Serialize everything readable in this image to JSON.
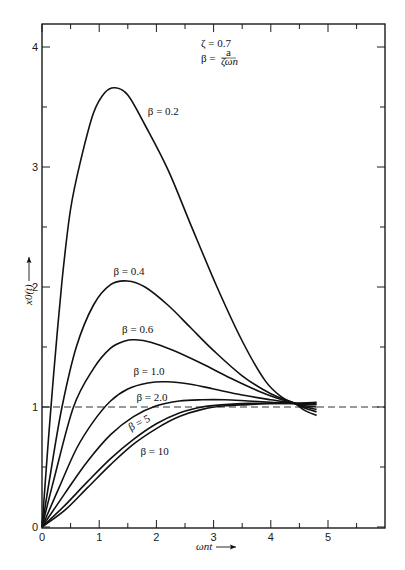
{
  "chart_data": {
    "type": "line",
    "title": "",
    "xlabel": "ωnt ⟶",
    "ylabel": "x0(t) ⟶",
    "xlim": [
      0,
      6
    ],
    "ylim": [
      0,
      4.2
    ],
    "grid": false,
    "x_ticks": [
      0,
      1,
      2,
      3,
      4,
      5
    ],
    "x_minor_ticks": [
      0.5,
      1.5,
      2.5,
      3.5,
      4.5,
      5.5
    ],
    "y_ticks": [
      0,
      1,
      2,
      3,
      4
    ],
    "y_minor_ticks": [
      0.5,
      1.5,
      2.5,
      3.5
    ],
    "annotations": [
      {
        "text": "ζ = 0.7",
        "x": 3.0,
        "y": 3.95
      },
      {
        "text": "β = a / (ζωn)",
        "x": 3.0,
        "y": 3.78
      }
    ],
    "reference_line": {
      "y": 1,
      "style": "dashed",
      "label": "steady state"
    },
    "series": [
      {
        "name": "β = 0.2",
        "label_pos": [
          1.85,
          3.43
        ],
        "label_rot": 0,
        "x": [
          0,
          0.1,
          0.2,
          0.35,
          0.5,
          0.7,
          0.9,
          1.1,
          1.28,
          1.5,
          1.8,
          2.2,
          2.6,
          3.06,
          3.5,
          3.9,
          4.2,
          4.42,
          4.6,
          4.8
        ],
        "y": [
          0,
          0.65,
          1.25,
          2.05,
          2.65,
          3.1,
          3.45,
          3.62,
          3.66,
          3.6,
          3.35,
          2.98,
          2.52,
          2.0,
          1.55,
          1.22,
          1.08,
          1.03,
          0.97,
          0.93
        ]
      },
      {
        "name": "β = 0.4",
        "label_pos": [
          1.25,
          2.1
        ],
        "label_rot": 0,
        "x": [
          0,
          0.15,
          0.35,
          0.6,
          0.9,
          1.2,
          1.49,
          1.8,
          2.2,
          2.6,
          3.0,
          3.5,
          4.0,
          4.42,
          4.6,
          4.8
        ],
        "y": [
          0,
          0.45,
          1.0,
          1.5,
          1.85,
          2.02,
          2.05,
          2.0,
          1.85,
          1.66,
          1.47,
          1.26,
          1.11,
          1.03,
          0.99,
          0.96
        ]
      },
      {
        "name": "β = 0.6",
        "label_pos": [
          1.4,
          1.62
        ],
        "label_rot": 0,
        "x": [
          0,
          0.2,
          0.55,
          0.9,
          1.2,
          1.45,
          1.63,
          1.9,
          2.3,
          2.8,
          3.3,
          3.8,
          4.2,
          4.42,
          4.6,
          4.8
        ],
        "y": [
          0,
          0.38,
          1.0,
          1.32,
          1.49,
          1.55,
          1.56,
          1.54,
          1.47,
          1.36,
          1.24,
          1.13,
          1.06,
          1.03,
          1.0,
          0.98
        ]
      },
      {
        "name": "β = 1.0",
        "label_pos": [
          1.6,
          1.27
        ],
        "label_rot": 0,
        "x": [
          0,
          0.3,
          0.6,
          0.9,
          1.2,
          1.5,
          1.85,
          2.18,
          2.6,
          3.0,
          3.5,
          4.0,
          4.42,
          4.6,
          4.8
        ],
        "y": [
          0,
          0.33,
          0.65,
          0.88,
          1.05,
          1.15,
          1.2,
          1.21,
          1.19,
          1.15,
          1.1,
          1.06,
          1.03,
          1.01,
          1.0
        ]
      },
      {
        "name": "β = 2.0",
        "label_pos": [
          1.65,
          1.05
        ],
        "label_rot": 0,
        "x": [
          0,
          0.4,
          0.8,
          1.2,
          1.6,
          2.0,
          2.4,
          2.8,
          3.2,
          3.6,
          4.0,
          4.42,
          4.6,
          4.8
        ],
        "y": [
          0,
          0.28,
          0.55,
          0.77,
          0.92,
          1.01,
          1.05,
          1.06,
          1.06,
          1.05,
          1.04,
          1.03,
          1.02,
          1.02
        ]
      },
      {
        "name": "β = 5",
        "label_pos": [
          1.55,
          0.8
        ],
        "label_rot": -27,
        "x": [
          0,
          0.4,
          0.8,
          1.2,
          1.6,
          2.0,
          2.4,
          2.8,
          3.2,
          3.6,
          4.0,
          4.42,
          4.8
        ],
        "y": [
          0,
          0.18,
          0.38,
          0.57,
          0.73,
          0.86,
          0.95,
          1.0,
          1.02,
          1.03,
          1.03,
          1.03,
          1.03
        ]
      },
      {
        "name": "β = 10",
        "label_pos": [
          1.72,
          0.6
        ],
        "label_rot": 0,
        "x": [
          0,
          0.4,
          0.8,
          1.2,
          1.6,
          2.0,
          2.4,
          2.8,
          3.2,
          3.6,
          4.0,
          4.42,
          4.8
        ],
        "y": [
          0,
          0.14,
          0.33,
          0.52,
          0.69,
          0.82,
          0.92,
          0.98,
          1.01,
          1.02,
          1.03,
          1.03,
          1.04
        ]
      }
    ]
  },
  "labels": {
    "zeta": "ζ = 0.7",
    "beta_lhs": "β =",
    "beta_num": "a",
    "beta_den": "ζωn",
    "xlabel_main": "ωnt",
    "ylabel_main": "x0(t)"
  }
}
